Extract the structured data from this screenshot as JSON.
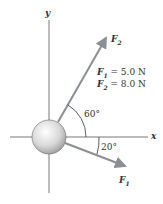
{
  "axes": {
    "x_label": "x",
    "y_label": "y"
  },
  "forces": [
    {
      "name": "F",
      "sub": "1",
      "magnitude": "5.0 N",
      "angle": "20°",
      "direction": "below +x axis"
    },
    {
      "name": "F",
      "sub": "2",
      "magnitude": "8.0 N",
      "angle": "60°",
      "direction": "above +x axis"
    }
  ],
  "legend": {
    "line1": {
      "name": "F",
      "sub": "1",
      "eq": " = 5.0 N"
    },
    "line2": {
      "name": "F",
      "sub": "2",
      "eq": " = 8.0 N"
    }
  },
  "angle_labels": {
    "f2": "60°",
    "f1": "20°"
  },
  "colors": {
    "axis": "#555555",
    "arrow": "#8a8f96",
    "ball": "#c8c8c8"
  }
}
